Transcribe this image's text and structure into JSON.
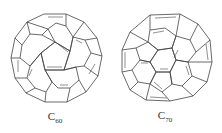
{
  "molecules": [
    {
      "name": "C60",
      "base": "C",
      "subscript": "60"
    },
    {
      "name": "C70",
      "base": "C",
      "subscript": "70"
    }
  ],
  "colors": {
    "stroke": "#444444",
    "background": "#ffffff"
  }
}
